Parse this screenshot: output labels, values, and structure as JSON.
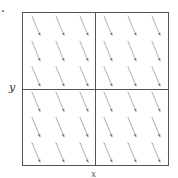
{
  "chart_data": {
    "type": "quiver",
    "title": "",
    "xlabel": "x",
    "ylabel": "y",
    "grid": {
      "rows": 2,
      "cols": 2
    },
    "arrow_grid": {
      "nx": 6,
      "ny": 6
    },
    "direction": {
      "dx": 0.42,
      "dy": -1.0
    },
    "note": "uniform field: all arrows identical, pointing down-right",
    "colors": {
      "frame": "#555555",
      "arrow": "#9a9a9a",
      "arrowhead": "#777777"
    }
  },
  "labels": {
    "y": "y",
    "x": "x"
  }
}
